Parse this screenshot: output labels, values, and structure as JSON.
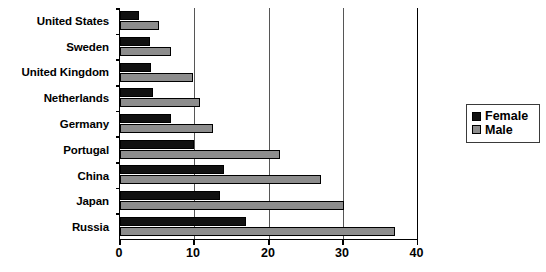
{
  "chart_data": {
    "type": "bar",
    "orientation": "horizontal",
    "title": "",
    "xlabel": "",
    "ylabel": "",
    "xlim": [
      0,
      40
    ],
    "xticks": [
      0,
      10,
      20,
      30,
      40
    ],
    "xtick_labels": [
      "0",
      "10",
      "20",
      "30",
      "40"
    ],
    "grid": true,
    "grid_axis": "x",
    "legend_position": "right",
    "categories": [
      "United States",
      "Sweden",
      "United Kingdom",
      "Netherlands",
      "Germany",
      "Portugal",
      "China",
      "Japan",
      "Russia"
    ],
    "series": [
      {
        "name": "Female",
        "color": "#111111",
        "values": [
          2.5,
          4.0,
          4.2,
          4.5,
          6.8,
          10.0,
          14.0,
          13.5,
          17.0
        ]
      },
      {
        "name": "Male",
        "color": "#8d8d8d",
        "values": [
          5.3,
          6.8,
          9.8,
          10.8,
          12.5,
          21.5,
          27.0,
          30.1,
          37.0
        ]
      }
    ]
  },
  "legend": {
    "items": [
      {
        "label": "Female",
        "color": "#111111"
      },
      {
        "label": "Male",
        "color": "#8d8d8d"
      }
    ]
  }
}
